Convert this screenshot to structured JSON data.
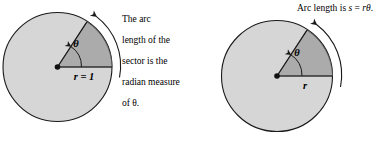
{
  "figure": {
    "type": "diagram",
    "colors": {
      "background": "#ffffff",
      "circle_fill": "#d6d6d6",
      "sector_fill": "#b0b0b0",
      "stroke": "#1a1a1a",
      "text": "#000000"
    },
    "panels": [
      {
        "id": "unit-circle",
        "center": [
          57.5,
          67
        ],
        "radius": 55,
        "sector_angle_deg": 57.3,
        "radius_label": "r = 1",
        "angle_label": "θ",
        "arc_arrow": true,
        "caption": "The arc\nlength of the\nsector is the\nradian measure\nof θ."
      },
      {
        "id": "general-circle",
        "center": [
          277,
          76
        ],
        "radius": 56,
        "sector_angle_deg": 57.3,
        "radius_label": "r",
        "angle_label": "θ",
        "arc_arrow": true,
        "caption": "Arc length is s = rθ."
      }
    ],
    "labels": {
      "left_radius": "r = 1",
      "left_theta": "θ",
      "left_caption_line1": "The arc",
      "left_caption_line2": "length of the",
      "left_caption_line3": "sector is the",
      "left_caption_line4": "radian measure",
      "left_caption_line5": "of θ.",
      "right_radius": "r",
      "right_theta": "θ",
      "right_caption_prefix": "Arc length is ",
      "right_caption_s": "s",
      "right_caption_eq": " = ",
      "right_caption_r": "r",
      "right_caption_theta": "θ",
      "right_caption_period": "."
    }
  }
}
